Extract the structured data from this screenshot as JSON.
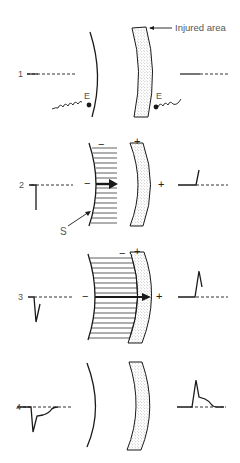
{
  "figure": {
    "annotation_injured": "Injured area",
    "electrode_label": "E",
    "stimulus_label": "S",
    "minus": "−",
    "plus": "+",
    "panels": [
      {
        "number": "1",
        "description": "resting state, both electrodes; flat baseline"
      },
      {
        "number": "2",
        "description": "depolarization starts, arrow toward injured area; left trace deflects down, right trace deflects up"
      },
      {
        "number": "3",
        "description": "depolarization reaches injured area; negative/positive spike"
      },
      {
        "number": "4",
        "description": "recovery; trace with spike and plateau returning to baseline"
      }
    ]
  },
  "colors": {
    "ink": "#1a1a1a",
    "label": "#555555",
    "stipple": "#8a8a8a"
  }
}
